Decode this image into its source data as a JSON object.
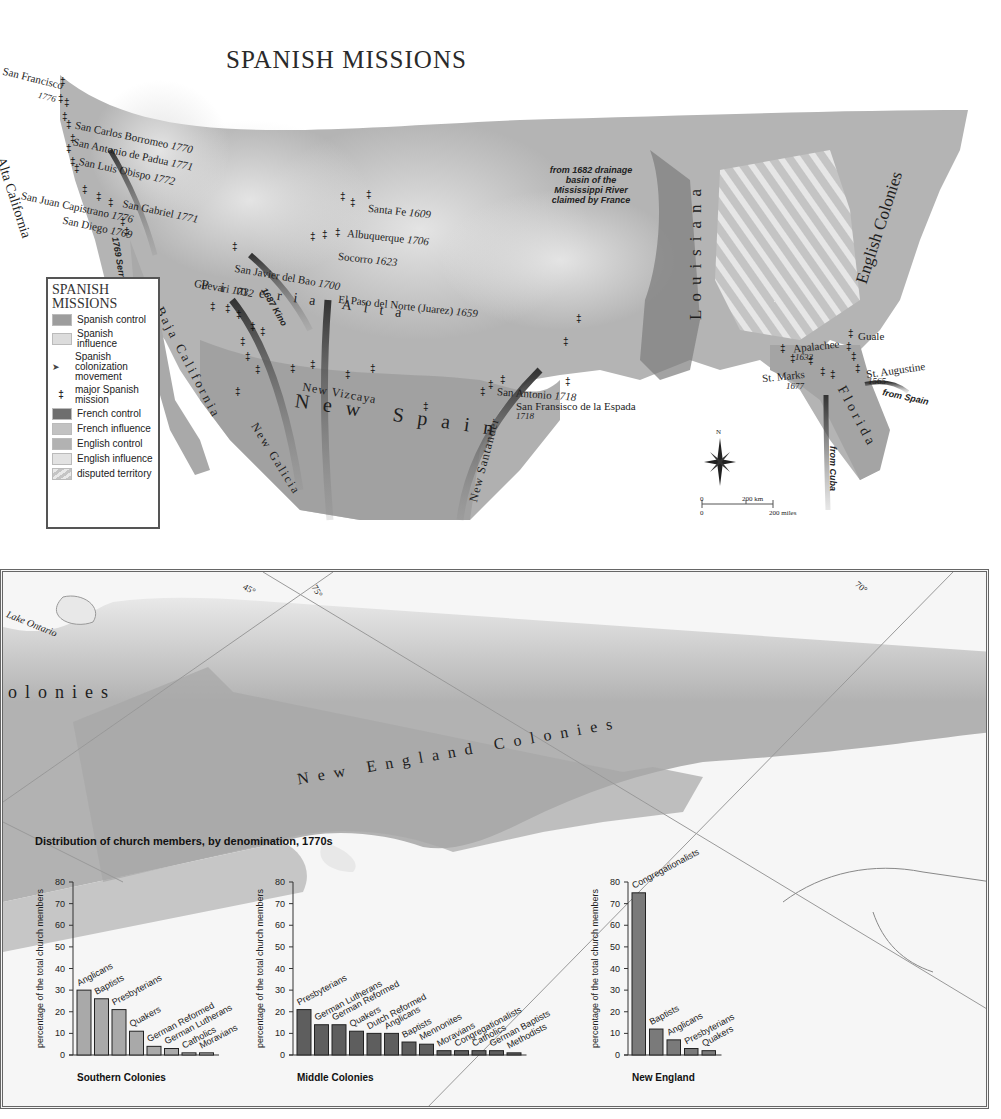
{
  "top_map": {
    "title": "SPANISH MISSIONS",
    "legend": {
      "heading_line1": "SPANISH",
      "heading_line2": "MISSIONS",
      "items": [
        {
          "label": "Spanish control",
          "swatch": "#9d9d9d"
        },
        {
          "label": "Spanish influence",
          "swatch": "#dcdcdc"
        },
        {
          "label": "Spanish colonization movement",
          "swatch": "arrow"
        },
        {
          "label": "major Spanish mission",
          "swatch": "cross"
        },
        {
          "label": "French control",
          "swatch": "#6e6e6e"
        },
        {
          "label": "French influence",
          "swatch": "#c2c2c2"
        },
        {
          "label": "English control",
          "swatch": "#b2b2b2"
        },
        {
          "label": "English influence",
          "swatch": "#e2e2e2"
        },
        {
          "label": "disputed territory",
          "swatch": "hatch"
        }
      ]
    },
    "place_labels": {
      "san_francisco": "San Francisco",
      "san_francisco_year": "1776",
      "san_carlos": "San Carlos Borromeo",
      "san_carlos_year": "1770",
      "san_antonio_padua": "San Antonio de Padua",
      "san_antonio_padua_year": "1771",
      "san_luis": "San Luis Obispo",
      "san_luis_year": "1772",
      "san_gabriel": "San Gabriel",
      "san_gabriel_year": "1771",
      "san_juan": "San Juan Capistrano",
      "san_juan_year": "1776",
      "san_diego": "San Diego",
      "san_diego_year": "1769",
      "santa_fe": "Santa Fe",
      "santa_fe_year": "1609",
      "albuquerque": "Albuquerque",
      "albuquerque_year": "1706",
      "socorro": "Socorro",
      "socorro_year": "1623",
      "san_javier": "San Javier del Bao",
      "san_javier_year": "1700",
      "guevari": "Guevari",
      "guevari_year": "1732",
      "el_paso": "El Paso del Norte (Juarez)",
      "el_paso_year": "1659",
      "san_antonio": "San Antonio",
      "san_antonio_year": "1718",
      "san_fransisco_espada": "San Fransisco de la Espada",
      "san_fransisco_espada_year": "1718",
      "apalachee": "Apalachee",
      "apalachee_year": "1632",
      "st_marks": "St. Marks",
      "st_marks_year": "1677",
      "guale": "Guale",
      "st_augustine": "St. Augustine",
      "st_augustine_year": "1565"
    },
    "region_labels": {
      "alta_california": "Alta California",
      "baja_california": "Baja California",
      "pimeria_alta": "Pimeria Alta",
      "new_vizcaya": "New Vizcaya",
      "new_spain": "New Spain",
      "new_galicia": "New Galicia",
      "new_santander": "New Santander",
      "louisiana": "Louisiana",
      "florida": "Florida",
      "english_colonies": "English Colonies"
    },
    "route_labels": {
      "serra": "1769 Serra",
      "kino": "1687 Kino",
      "from_spain": "from Spain",
      "from_cuba": "from Cuba"
    },
    "annotation": "from 1682 drainage basin of the Mississippi River claimed by France",
    "compass": "N",
    "scale": {
      "zero": "0",
      "km": "200 km",
      "miles": "200 miles"
    }
  },
  "bottom_map": {
    "labels": {
      "lake_ontario": "Lake Ontario",
      "colonies_partial": "olonies",
      "new_england_colonies": "New England Colonies",
      "lat_45": "45°",
      "lon_75": "75°",
      "lon_70": "70°"
    },
    "chart_section_title": "Distribution of church members, by denomination, 1770s"
  },
  "chart_data": [
    {
      "type": "bar",
      "title": "Southern Colonies",
      "ylabel": "percentage of the total church members",
      "xlabel": "",
      "ylim": [
        0,
        80
      ],
      "yticks": [
        0,
        10,
        20,
        30,
        40,
        50,
        60,
        70,
        80
      ],
      "categories": [
        "Anglicans",
        "Baptists",
        "Presbyterians",
        "Quakers",
        "German Reformed",
        "German Lutherans",
        "Catholics",
        "Moravians"
      ],
      "values": [
        30,
        26,
        21,
        11,
        4,
        3,
        1,
        1
      ],
      "bar_color": "#a9a9a9",
      "grid": false
    },
    {
      "type": "bar",
      "title": "Middle Colonies",
      "ylabel": "percentage of the total church members",
      "xlabel": "",
      "ylim": [
        0,
        80
      ],
      "yticks": [
        0,
        10,
        20,
        30,
        40,
        50,
        60,
        70,
        80
      ],
      "categories": [
        "Presbyterians",
        "German Lutherans",
        "German Reformed",
        "Quakers",
        "Dutch Reformed",
        "Anglicans",
        "Baptists",
        "Mennonites",
        "Moravians",
        "Congregationalists",
        "Catholics",
        "German Baptists",
        "Methodists"
      ],
      "values": [
        21,
        14,
        14,
        11,
        10,
        10,
        6,
        5,
        2,
        2,
        2,
        2,
        1
      ],
      "bar_color": "#5e5e5e",
      "grid": false
    },
    {
      "type": "bar",
      "title": "New England",
      "ylabel": "percentage of the total church members",
      "xlabel": "",
      "ylim": [
        0,
        80
      ],
      "yticks": [
        0,
        10,
        20,
        30,
        40,
        50,
        60,
        70,
        80
      ],
      "categories": [
        "Congregationalists",
        "Baptists",
        "Anglicans",
        "Presbyterians",
        "Quakers"
      ],
      "values": [
        75,
        12,
        7,
        3,
        2
      ],
      "bar_color": "#7a7a7a",
      "grid": false
    }
  ]
}
